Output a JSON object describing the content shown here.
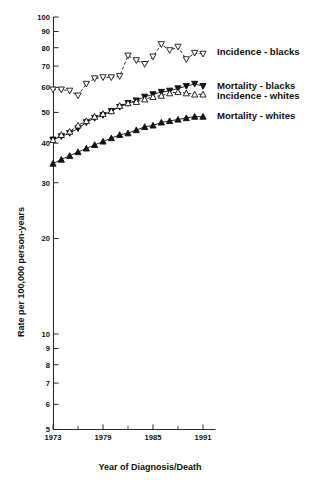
{
  "figure": {
    "background": "#ffffff",
    "ink": "#111111"
  },
  "chart_data": {
    "type": "line",
    "title": "",
    "subtitle": "",
    "xlabel": "Year of Diagnosis/Death",
    "ylabel": "Rate per 100,000 person-years",
    "yscale": "log",
    "ylim": [
      5,
      100
    ],
    "xlim": [
      1973,
      1992
    ],
    "grid": false,
    "legend_position": "right-inline",
    "ytick_labels": [
      "100",
      "90",
      "80",
      "70",
      "60",
      "50",
      "40",
      "30",
      "20",
      "10",
      "9",
      "8",
      "7",
      "6",
      "5"
    ],
    "yticks": [
      100,
      90,
      80,
      70,
      60,
      50,
      40,
      30,
      20,
      10,
      9,
      8,
      7,
      6,
      5
    ],
    "xtick_labels": [
      "1973",
      "1979",
      "1985",
      "1991"
    ],
    "xticks": [
      1973,
      1979,
      1985,
      1991
    ],
    "xminor_ticks": [
      1976,
      1982,
      1988
    ],
    "x": [
      1973,
      1974,
      1975,
      1976,
      1977,
      1978,
      1979,
      1980,
      1981,
      1982,
      1983,
      1984,
      1985,
      1986,
      1987,
      1988,
      1989,
      1990,
      1991
    ],
    "series": [
      {
        "name": "Incidence - blacks",
        "marker": "triangle-down-open",
        "linestyle": "dashed",
        "color": "#111111",
        "label": "Incidence - blacks",
        "values": [
          59.0,
          59.0,
          58.5,
          56.5,
          61.5,
          64.0,
          64.5,
          64.5,
          65.0,
          75.5,
          73.0,
          71.0,
          75.0,
          82.0,
          78.5,
          80.5,
          73.5,
          77.0,
          76.5
        ]
      },
      {
        "name": "Mortality - blacks",
        "marker": "triangle-down-filled",
        "linestyle": "solid",
        "color": "#111111",
        "label": "Mortality - blacks",
        "values": [
          41.0,
          42.0,
          43.0,
          44.5,
          46.5,
          48.0,
          49.0,
          50.5,
          52.0,
          53.5,
          54.5,
          56.0,
          57.0,
          58.0,
          58.5,
          59.5,
          60.5,
          61.5,
          60.5
        ]
      },
      {
        "name": "Incidence - whites",
        "marker": "triangle-up-open",
        "linestyle": "dashed",
        "color": "#111111",
        "label": "Incidence - whites",
        "values": [
          41.0,
          42.5,
          43.5,
          45.5,
          47.0,
          48.5,
          49.5,
          50.5,
          52.5,
          53.5,
          54.0,
          55.0,
          56.0,
          56.5,
          57.5,
          58.0,
          57.5,
          57.0,
          57.0
        ]
      },
      {
        "name": "Mortality - whites",
        "marker": "triangle-up-filled",
        "linestyle": "solid",
        "color": "#111111",
        "label": "Mortality - whites",
        "values": [
          34.5,
          35.5,
          36.5,
          37.5,
          38.5,
          39.5,
          40.5,
          41.5,
          42.5,
          43.0,
          44.0,
          45.0,
          45.5,
          46.5,
          47.0,
          47.5,
          48.0,
          48.5,
          48.5
        ]
      }
    ],
    "annotations": [
      {
        "text": "Incidence - blacks",
        "x": 1992.2,
        "y": 78.0
      },
      {
        "text": "Mortality - blacks",
        "x": 1992.2,
        "y": 61.0
      },
      {
        "text": "Incidence - whites",
        "x": 1992.2,
        "y": 56.5
      },
      {
        "text": "Mortality - whites",
        "x": 1992.2,
        "y": 49.0
      }
    ]
  }
}
